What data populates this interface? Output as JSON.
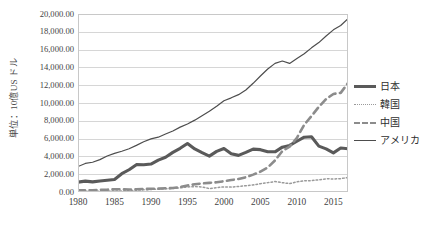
{
  "chart_data": {
    "type": "line",
    "title": "",
    "subtitle": "",
    "xlabel": "",
    "ylabel": "単位：10億US ドル",
    "xlim": [
      1980,
      2017
    ],
    "ylim": [
      0,
      20000
    ],
    "grid": true,
    "grid_axis": "y",
    "legend_position": "right",
    "x": [
      1980,
      1981,
      1982,
      1983,
      1984,
      1985,
      1986,
      1987,
      1988,
      1989,
      1990,
      1991,
      1992,
      1993,
      1994,
      1995,
      1996,
      1997,
      1998,
      1999,
      2000,
      2001,
      2002,
      2003,
      2004,
      2005,
      2006,
      2007,
      2008,
      2009,
      2010,
      2011,
      2012,
      2013,
      2014,
      2015,
      2016,
      2017
    ],
    "y_ticks": [
      0,
      2000,
      4000,
      6000,
      8000,
      10000,
      12000,
      14000,
      16000,
      18000,
      20000
    ],
    "y_tick_labels": [
      "0.00",
      "2,000.00",
      "4,000.00",
      "6,000.00",
      "8,000.00",
      "10,000.00",
      "12,000.00",
      "14,000.00",
      "16,000.00",
      "18,000.00",
      "20,000.00"
    ],
    "x_ticks": [
      1980,
      1985,
      1990,
      1995,
      2000,
      2005,
      2010,
      2015
    ],
    "x_tick_labels": [
      "1980",
      "1985",
      "1990",
      "1995",
      "2000",
      "2005",
      "2010",
      "2015"
    ],
    "series": [
      {
        "name": "日本",
        "style": "solid-thick",
        "color": "#5a5a5a",
        "width": 3.1,
        "values": [
          1105,
          1218,
          1135,
          1243,
          1318,
          1399,
          2053,
          2500,
          3072,
          3055,
          3140,
          3585,
          3909,
          4455,
          4908,
          5449,
          4834,
          4415,
          4033,
          4562,
          4888,
          4303,
          4115,
          4446,
          4816,
          4756,
          4530,
          4515,
          5038,
          5231,
          5700,
          6157,
          6203,
          5156,
          4850,
          4395,
          4940,
          4860
        ]
      },
      {
        "name": "韓国",
        "style": "dotted",
        "color": "#9a9a9a",
        "width": 1.5,
        "values": [
          65,
          72,
          78,
          88,
          97,
          101,
          116,
          146,
          200,
          243,
          283,
          330,
          356,
          392,
          463,
          566,
          610,
          569,
          383,
          497,
          576,
          548,
          627,
          703,
          794,
          935,
          1053,
          1173,
          1049,
          944,
          1144,
          1253,
          1278,
          1370,
          1484,
          1466,
          1500,
          1623
        ]
      },
      {
        "name": "中国",
        "style": "dashed",
        "color": "#8c8c8c",
        "width": 2.6,
        "values": [
          191,
          196,
          205,
          230,
          260,
          309,
          300,
          273,
          312,
          348,
          361,
          383,
          427,
          445,
          564,
          735,
          863,
          962,
          1029,
          1094,
          1211,
          1339,
          1471,
          1660,
          1955,
          2286,
          2752,
          3550,
          4594,
          5102,
          6087,
          7552,
          8532,
          9570,
          10438,
          11016,
          11138,
          12238
        ]
      },
      {
        "name": "アメリカ",
        "style": "solid-thin",
        "color": "#4d4d4d",
        "width": 1.2,
        "values": [
          2857,
          3207,
          3344,
          3634,
          4038,
          4339,
          4580,
          4855,
          5236,
          5642,
          5963,
          6158,
          6520,
          6858,
          7287,
          7640,
          8073,
          8577,
          9063,
          9631,
          10252,
          10582,
          10936,
          11458,
          12214,
          13037,
          13815,
          14452,
          14713,
          14449,
          14992,
          15543,
          16197,
          16785,
          17522,
          18219,
          18707,
          19485
        ]
      }
    ]
  }
}
